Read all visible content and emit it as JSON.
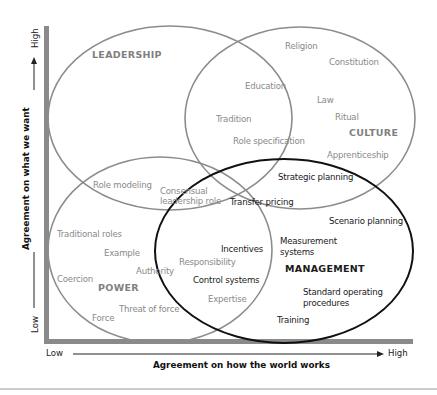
{
  "diagram": {
    "type": "venn",
    "y_axis": {
      "label": "Agreement on what we want",
      "low": "Low",
      "high": "High"
    },
    "x_axis": {
      "label": "Agreement on how the world works",
      "low": "Low",
      "high": "High"
    },
    "sets": [
      {
        "name": "LEADERSHIP",
        "color": "#8c8c8c"
      },
      {
        "name": "CULTURE",
        "color": "#8c8c8c"
      },
      {
        "name": "POWER",
        "color": "#8c8c8c"
      },
      {
        "name": "MANAGEMENT",
        "color": "#111111"
      }
    ],
    "items": {
      "religion": "Religion",
      "constitution": "Constitution",
      "education": "Education",
      "law": "Law",
      "tradition": "Tradition",
      "ritual": "Ritual",
      "role_specification": "Role specification",
      "apprenticeship": "Apprenticeship",
      "role_modeling": "Role modeling",
      "consensual_1": "Consensual",
      "consensual_2": "leadership role",
      "strategic_planning": "Strategic planning",
      "transfer_pricing": "Transfer pricing",
      "scenario_planning": "Scenario planning",
      "traditional_roles": "Traditional roles",
      "example": "Example",
      "authority": "Authority",
      "responsibility": "Responsibility",
      "incentives": "Incentives",
      "measurement_1": "Measurement",
      "measurement_2": "systems",
      "control_systems": "Control systems",
      "coercion": "Coercion",
      "expertise": "Expertise",
      "sop_1": "Standard operating",
      "sop_2": "procedures",
      "threat_of_force": "Threat of force",
      "force": "Force",
      "training": "Training"
    }
  }
}
